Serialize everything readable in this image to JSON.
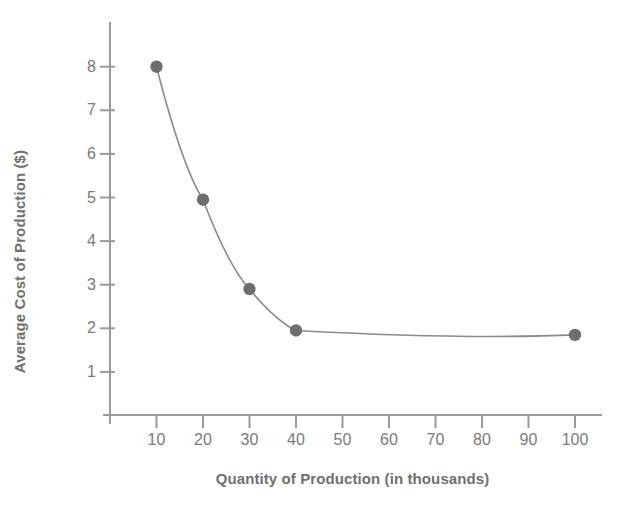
{
  "chart_data": {
    "type": "line",
    "title": "",
    "subtitle": "",
    "xlabel": "Quantity of Production (in thousands)",
    "ylabel": "Average Cost of Production ($)",
    "x": [
      10,
      20,
      30,
      40,
      100
    ],
    "values": [
      8.0,
      4.95,
      2.9,
      1.95,
      1.85
    ],
    "series": [
      {
        "name": "Average Cost of Production",
        "x": [
          10,
          20,
          30,
          40,
          100
        ],
        "values": [
          8.0,
          4.95,
          2.9,
          1.95,
          1.85
        ]
      }
    ],
    "xticks": [
      10,
      20,
      30,
      40,
      50,
      60,
      70,
      80,
      90,
      100
    ],
    "xtick_labels": [
      "10",
      "20",
      "30",
      "40",
      "50",
      "60",
      "70",
      "80",
      "90",
      "100"
    ],
    "yticks": [
      1,
      2,
      3,
      4,
      5,
      6,
      7,
      8
    ],
    "ytick_labels": [
      "1",
      "2",
      "3",
      "4",
      "5",
      "6",
      "7",
      "8"
    ],
    "xlim": [
      0,
      110
    ],
    "ylim": [
      0,
      9
    ],
    "grid": false,
    "legend": false,
    "legend_position": "none",
    "annotations": [],
    "marker": "circle",
    "marker_color": "#6e6e6e",
    "line_color": "#8a8a8a",
    "axis_color": "#9a9a9a",
    "text_color": "#6f6f6f",
    "background_color": "#ffffff"
  },
  "figure": {
    "x_axis_title": "Quantity of Production (in thousands)",
    "y_axis_title": "Average Cost of Production ($)"
  }
}
